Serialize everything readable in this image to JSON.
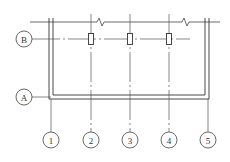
{
  "diagram": {
    "type": "structural-axis-plan",
    "row_axes": [
      {
        "label": "B"
      },
      {
        "label": "A"
      }
    ],
    "column_axes": [
      {
        "label": "1"
      },
      {
        "label": "2"
      },
      {
        "label": "3"
      },
      {
        "label": "4"
      },
      {
        "label": "5"
      }
    ],
    "column_members_on_axis_B": [
      "2",
      "3",
      "4"
    ],
    "break_marks": 2,
    "colors": {
      "line": "#333333",
      "background": "#ffffff"
    }
  }
}
